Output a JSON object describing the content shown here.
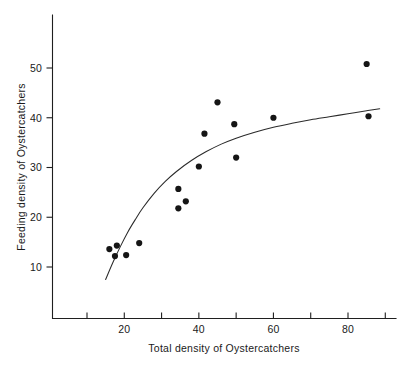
{
  "chart_data": {
    "type": "scatter",
    "title": "",
    "subtitle": "",
    "xlabel": "Total density of Oystercatchers",
    "ylabel": "Feeding density of Oystercatchers",
    "xlim": [
      5,
      95
    ],
    "ylim": [
      0,
      57
    ],
    "grid": false,
    "legend": null,
    "legend_position": "none",
    "x_major_ticks": [
      20,
      40,
      60,
      80
    ],
    "x_major_tick_labels": [
      "20",
      "40",
      "60",
      "80"
    ],
    "x_minor_ticks": [
      10,
      30,
      50,
      70,
      90
    ],
    "y_major_ticks": [
      10,
      20,
      30,
      40,
      50
    ],
    "y_major_tick_labels": [
      "10",
      "20",
      "30",
      "40",
      "50"
    ],
    "y_minor_ticks": [],
    "marker": "filled-circle",
    "marker_color": "#151515",
    "marker_size_px": 3.1,
    "points": [
      {
        "x": 16.0,
        "y": 13.6
      },
      {
        "x": 18.0,
        "y": 14.3
      },
      {
        "x": 17.5,
        "y": 12.2
      },
      {
        "x": 20.5,
        "y": 12.4
      },
      {
        "x": 24.0,
        "y": 14.8
      },
      {
        "x": 34.5,
        "y": 21.8
      },
      {
        "x": 34.5,
        "y": 25.7
      },
      {
        "x": 36.5,
        "y": 23.2
      },
      {
        "x": 40.0,
        "y": 30.2
      },
      {
        "x": 41.5,
        "y": 36.8
      },
      {
        "x": 45.0,
        "y": 43.1
      },
      {
        "x": 49.5,
        "y": 38.7
      },
      {
        "x": 50.0,
        "y": 32.0
      },
      {
        "x": 60.0,
        "y": 40.0
      },
      {
        "x": 85.0,
        "y": 50.8
      },
      {
        "x": 85.5,
        "y": 40.3
      }
    ],
    "series": [
      {
        "name": "fitted-curve",
        "type": "line",
        "color": "#2a2a2a",
        "x": [
          15.0,
          17.0,
          19.0,
          21.0,
          23.0,
          25.0,
          28.0,
          31.0,
          34.0,
          38.0,
          42.0,
          46.0,
          50.0,
          55.0,
          60.0,
          65.0,
          70.0,
          75.0,
          80.0,
          85.0,
          88.5
        ],
        "values": [
          7.5,
          11.0,
          14.2,
          17.1,
          19.6,
          21.9,
          24.8,
          27.2,
          29.2,
          31.4,
          33.2,
          34.7,
          35.9,
          37.1,
          38.1,
          38.9,
          39.6,
          40.2,
          40.8,
          41.4,
          41.8
        ]
      }
    ],
    "annotations": []
  },
  "figure": {
    "background_color": "#ffffff",
    "axis_color": "#1f1f1f"
  }
}
